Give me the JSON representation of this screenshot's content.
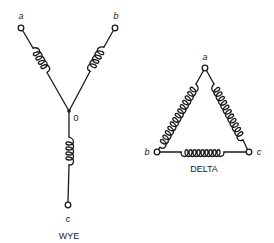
{
  "wye": {
    "caption": "WYE",
    "terminals": [
      {
        "id": "a",
        "label": "a"
      },
      {
        "id": "b",
        "label": "b"
      },
      {
        "id": "c",
        "label": "c"
      }
    ],
    "neutral": {
      "label": "0"
    }
  },
  "delta": {
    "caption": "DELTA",
    "vertices": [
      {
        "id": "a",
        "label": "a"
      },
      {
        "id": "b",
        "label": "b"
      },
      {
        "id": "c",
        "label": "c"
      }
    ]
  },
  "colors": {
    "ink": "#1a1a1a",
    "background": "#ffffff"
  }
}
